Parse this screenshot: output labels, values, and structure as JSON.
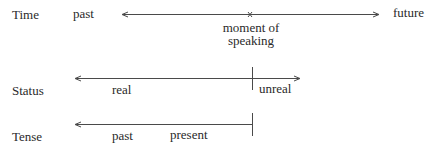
{
  "rows": {
    "time": {
      "label": "Time",
      "left_label": "past",
      "right_label": "future",
      "marker_label_line1": "moment of",
      "marker_label_line2": "speaking"
    },
    "status": {
      "label": "Status",
      "left_label": "real",
      "right_label": "unreal"
    },
    "tense": {
      "label": "Tense",
      "left_label": "past",
      "right_label": "present"
    }
  },
  "colors": {
    "ink": "#2a2a2a",
    "background": "#ffffff"
  }
}
